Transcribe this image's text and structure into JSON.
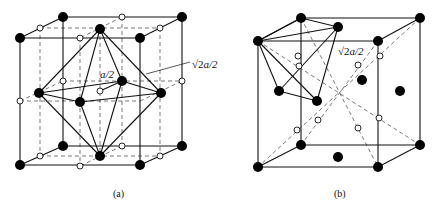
{
  "figure": {
    "panels": [
      {
        "id": "a",
        "caption": "(a)",
        "annotations": {
          "inner": "a/2",
          "outer_sqrt": "√2",
          "outer_rest": "a/2"
        }
      },
      {
        "id": "b",
        "caption": "(b)",
        "annotations": {
          "outer_sqrt": "√2",
          "outer_rest": "a/2"
        }
      }
    ],
    "legend": {
      "filled_circle": "atom (black dot)",
      "open_circle": "interstitial site (open dot)"
    }
  }
}
